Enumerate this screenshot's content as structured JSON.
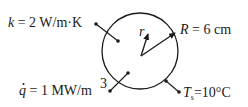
{
  "diagram": {
    "type": "sphere-heat-generation",
    "labels": {
      "k_symbol": "k",
      "k_value": " = 2 W/m·K",
      "R_symbol": "R",
      "R_value": " = 6 cm",
      "r_symbol": "r",
      "q_symbol": "q",
      "q_value": " = 1 MW/m",
      "q_exp": "3",
      "Ts_symbol": "T",
      "Ts_sub": "s",
      "Ts_value": "=10°C"
    },
    "colors": {
      "line": "#1a1a1a",
      "text": "#1a1a1a",
      "background": "#ffffff"
    }
  }
}
